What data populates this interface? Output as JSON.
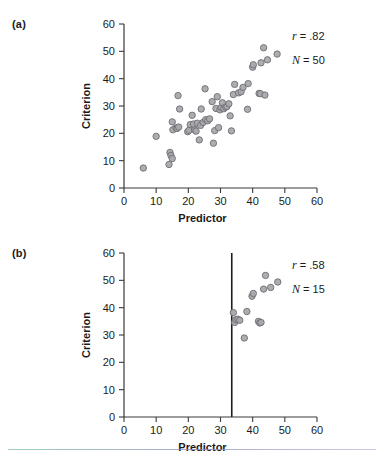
{
  "figure": {
    "panels": [
      {
        "key": "a",
        "label": "(a)",
        "stats": {
          "r_symbol": "r",
          "r_text": "= .82",
          "n_symbol": "N",
          "n_text": "= 50"
        }
      },
      {
        "key": "b",
        "label": "(b)",
        "stats": {
          "r_symbol": "r",
          "r_text": "= .58",
          "n_symbol": "N",
          "n_text": "= 15"
        }
      }
    ]
  },
  "chart_data": [
    {
      "type": "scatter",
      "panel": "a",
      "title": "",
      "xlabel": "Predictor",
      "ylabel": "Criterion",
      "xlim": [
        0,
        60
      ],
      "ylim": [
        0,
        60
      ],
      "xticks": [
        0,
        10,
        20,
        30,
        40,
        50,
        60
      ],
      "yticks": [
        0,
        10,
        20,
        30,
        40,
        50,
        60
      ],
      "grid": false,
      "legend": "none",
      "annotations": [
        "r = .82",
        "N = 50"
      ],
      "r": 0.82,
      "n": 50,
      "marker": {
        "shape": "circle",
        "fill": "#a9a9ad",
        "edge": "#6e6e73",
        "size_px": 6.4
      },
      "points": [
        [
          6.0,
          7.3
        ],
        [
          10.0,
          18.9
        ],
        [
          14.0,
          8.6
        ],
        [
          14.3,
          13.0
        ],
        [
          14.6,
          11.9
        ],
        [
          15.0,
          10.8
        ],
        [
          15.0,
          24.2
        ],
        [
          15.2,
          21.3
        ],
        [
          16.2,
          22.0
        ],
        [
          16.5,
          21.8
        ],
        [
          16.8,
          33.8
        ],
        [
          17.0,
          22.3
        ],
        [
          17.3,
          28.9
        ],
        [
          19.8,
          20.6
        ],
        [
          20.2,
          21.1
        ],
        [
          20.6,
          23.2
        ],
        [
          21.2,
          26.6
        ],
        [
          21.6,
          23.4
        ],
        [
          22.0,
          21.2
        ],
        [
          22.4,
          20.8
        ],
        [
          22.8,
          23.7
        ],
        [
          23.4,
          17.6
        ],
        [
          23.8,
          22.9
        ],
        [
          24.0,
          28.9
        ],
        [
          24.6,
          24.0
        ],
        [
          25.2,
          36.3
        ],
        [
          25.4,
          25.0
        ],
        [
          26.0,
          24.6
        ],
        [
          26.6,
          25.3
        ],
        [
          27.4,
          31.6
        ],
        [
          27.8,
          16.4
        ],
        [
          28.2,
          21.0
        ],
        [
          28.6,
          29.1
        ],
        [
          29.0,
          33.4
        ],
        [
          29.4,
          22.1
        ],
        [
          29.8,
          28.6
        ],
        [
          30.2,
          29.4
        ],
        [
          30.6,
          31.2
        ],
        [
          31.0,
          29.0
        ],
        [
          31.6,
          29.6
        ],
        [
          32.0,
          29.8
        ],
        [
          32.6,
          30.8
        ],
        [
          33.0,
          26.4
        ],
        [
          33.4,
          20.9
        ],
        [
          34.0,
          34.2
        ],
        [
          34.4,
          37.9
        ],
        [
          35.6,
          34.8
        ],
        [
          36.4,
          35.2
        ],
        [
          37.0,
          36.8
        ],
        [
          38.4,
          28.8
        ],
        [
          38.6,
          38.2
        ],
        [
          40.0,
          44.2
        ],
        [
          40.2,
          45.1
        ],
        [
          42.0,
          34.6
        ],
        [
          42.4,
          34.5
        ],
        [
          42.6,
          45.8
        ],
        [
          43.4,
          51.3
        ],
        [
          43.8,
          34.0
        ],
        [
          44.6,
          46.9
        ],
        [
          47.6,
          49.0
        ]
      ]
    },
    {
      "type": "scatter",
      "panel": "b",
      "title": "",
      "xlabel": "Predictor",
      "ylabel": "Criterion",
      "xlim": [
        0,
        60
      ],
      "ylim": [
        0,
        60
      ],
      "xticks": [
        0,
        10,
        20,
        30,
        40,
        50,
        60
      ],
      "yticks": [
        0,
        10,
        20,
        30,
        40,
        50,
        60
      ],
      "grid": false,
      "legend": "none",
      "annotations": [
        "r = .58",
        "N = 15"
      ],
      "r": 0.58,
      "n": 15,
      "cutoff_line_x": 33.5,
      "marker": {
        "shape": "circle",
        "fill": "#a9a9ad",
        "edge": "#6e6e73",
        "size_px": 6.4
      },
      "points": [
        [
          34.0,
          38.2
        ],
        [
          34.4,
          34.6
        ],
        [
          34.8,
          35.6
        ],
        [
          35.4,
          35.8
        ],
        [
          36.0,
          35.4
        ],
        [
          37.4,
          28.9
        ],
        [
          38.2,
          38.6
        ],
        [
          39.8,
          44.2
        ],
        [
          40.2,
          45.2
        ],
        [
          41.8,
          35.0
        ],
        [
          42.2,
          34.4
        ],
        [
          42.6,
          34.6
        ],
        [
          43.4,
          46.8
        ],
        [
          44.0,
          51.8
        ],
        [
          45.6,
          47.4
        ],
        [
          47.8,
          49.4
        ]
      ]
    }
  ]
}
